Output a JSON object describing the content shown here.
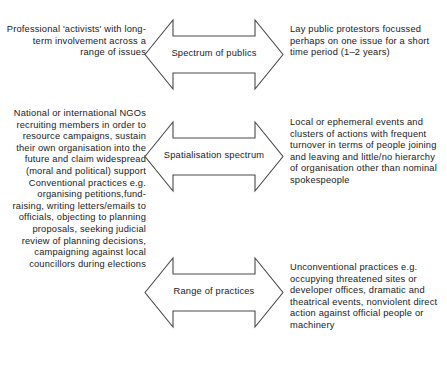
{
  "diagram": {
    "stroke_color": "#4a4a4a",
    "text_color": "#1a1a1a",
    "background_color": "#ffffff",
    "rows": [
      {
        "id": "spectrum-of-publics",
        "arrow_label": "Spectrum of publics",
        "left_text": "Professional 'activists' with long-term involvement across a range of issues",
        "right_text": "Lay public protestors focussed perhaps on one issue for a short time period (1–2 years)"
      },
      {
        "id": "spatialisation-spectrum",
        "arrow_label": "Spatialisation spectrum",
        "left_text": "National or international NGOs recruiting members in order to resource campaigns, sustain their own organisation into the future and claim widespread (moral and political) support Conventional practices e.g. organising petitions,fund-raising, writing letters/emails to officials, objecting to planning proposals, seeking judicial review of planning decisions, campaigning against local councillors during elections",
        "right_text": "Local or ephemeral events and clusters of actions with frequent turnover in terms of people joining and leaving and little/no hierarchy of organisation other than nominal spokespeople"
      },
      {
        "id": "range-of-practices",
        "arrow_label": "Range of practices",
        "left_text": "",
        "right_text": "Unconventional practices e.g. occupying threatened sites or developer offices, dramatic and theatrical events, nonviolent direct action against official people or machinery"
      }
    ]
  }
}
